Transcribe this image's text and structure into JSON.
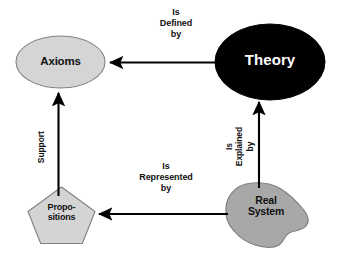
{
  "diagram": {
    "colors": {
      "background": "#ffffff",
      "theory_fill": "#000000",
      "theory_text": "#ffffff",
      "axioms_fill": "#d5d5d5",
      "propositions_fill": "#d4d4d4",
      "real_system_fill": "#a8a8a8",
      "shape_stroke": "#7a7a7a",
      "arrow": "#000000",
      "label_text": "#111111"
    },
    "nodes": [
      {
        "id": "axioms",
        "label": "Axioms",
        "shape": "ellipse",
        "fill": "#d5d5d5",
        "text_color": "#111111"
      },
      {
        "id": "theory",
        "label": "Theory",
        "shape": "ellipse",
        "fill": "#000000",
        "text_color": "#ffffff"
      },
      {
        "id": "propositions",
        "label": "Propo-\nsitions",
        "shape": "pentagon",
        "fill": "#d4d4d4",
        "text_color": "#111111"
      },
      {
        "id": "real-system",
        "label": "Real\nSystem",
        "shape": "blob",
        "fill": "#a8a8a8",
        "text_color": "#111111"
      }
    ],
    "edges": [
      {
        "id": "theory-to-axioms",
        "from": "theory",
        "to": "axioms",
        "label": "Is\nDefined\nby",
        "direction": "left",
        "orientation": "horizontal"
      },
      {
        "id": "real-system-to-theory",
        "from": "real-system",
        "to": "theory",
        "label": "Is\nExplained\nby",
        "direction": "up",
        "orientation": "vertical"
      },
      {
        "id": "real-system-to-propositions",
        "from": "real-system",
        "to": "propositions",
        "label": "Is\nRepresented\nby",
        "direction": "left",
        "orientation": "horizontal"
      },
      {
        "id": "propositions-to-axioms",
        "from": "propositions",
        "to": "axioms",
        "label": "Support",
        "direction": "up",
        "orientation": "vertical"
      }
    ]
  }
}
